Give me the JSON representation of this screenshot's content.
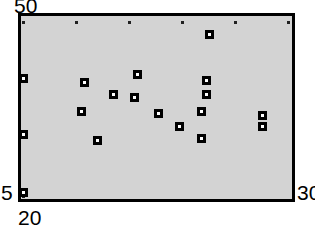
{
  "chart_data": {
    "type": "scatter",
    "title": "",
    "subtitle": "",
    "xlabel": "",
    "ylabel": "",
    "xlim": [
      20,
      30
    ],
    "ylim": [
      5,
      50
    ],
    "grid": false,
    "legend": null,
    "axis_labels": {
      "y_max": "50",
      "y_min": "5",
      "x_min": "20",
      "x_max": "30"
    },
    "x_ticks": [
      20,
      22,
      24,
      26,
      28,
      30
    ],
    "y_ticks": [
      5,
      20,
      35,
      50
    ],
    "marker_style": "open-square",
    "marker_color": "#000000",
    "plot_background": "#d3d3d3",
    "frame_color": "#000000",
    "points": [
      {
        "x": 20.0,
        "y": 49.0
      },
      {
        "x": 20.0,
        "y": 34.0
      },
      {
        "x": 20.0,
        "y": 19.5
      },
      {
        "x": 22.8,
        "y": 35.5
      },
      {
        "x": 22.2,
        "y": 28.0
      },
      {
        "x": 22.3,
        "y": 20.5
      },
      {
        "x": 23.4,
        "y": 23.5
      },
      {
        "x": 24.2,
        "y": 24.5
      },
      {
        "x": 25.1,
        "y": 28.5
      },
      {
        "x": 24.3,
        "y": 18.5
      },
      {
        "x": 25.9,
        "y": 32.0
      },
      {
        "x": 26.7,
        "y": 35.0
      },
      {
        "x": 26.7,
        "y": 28.0
      },
      {
        "x": 26.9,
        "y": 23.5
      },
      {
        "x": 26.9,
        "y": 20.0
      },
      {
        "x": 27.0,
        "y": 8.0
      },
      {
        "x": 29.0,
        "y": 32.0
      },
      {
        "x": 29.0,
        "y": 29.0
      }
    ]
  },
  "chart_meta": {
    "x_tick_pixels": [
      23,
      76,
      129,
      182,
      235,
      288
    ],
    "y_tick_pixels": [
      22,
      80,
      137,
      196
    ],
    "point_pixels": [
      [
        23,
        21
      ],
      [
        23,
        80
      ],
      [
        23,
        137
      ],
      [
        97,
        82
      ],
      [
        77,
        110
      ],
      [
        78,
        138
      ],
      [
        107,
        126
      ],
      [
        130,
        126
      ],
      [
        130,
        92
      ],
      [
        117,
        133
      ],
      [
        150,
        82
      ],
      [
        171,
        70
      ],
      [
        171,
        93
      ],
      [
        179,
        110
      ],
      [
        179,
        123
      ],
      [
        180,
        184
      ],
      [
        231,
        82
      ],
      [
        231,
        93
      ]
    ]
  }
}
